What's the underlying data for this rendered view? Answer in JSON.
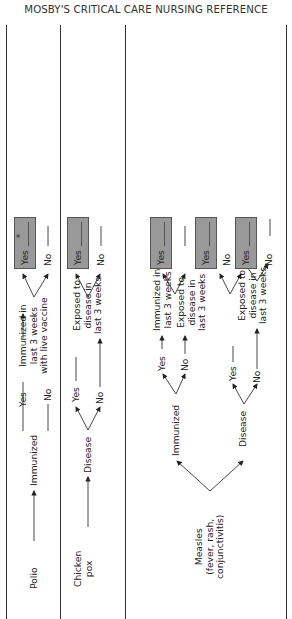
{
  "header": {
    "title": "MOSBY'S CRITICAL CARE NURSING REFERENCE"
  },
  "rows": {
    "polio": {
      "disease": "Polio",
      "branch": "Immunized",
      "yes": "Yes",
      "no": "No",
      "question": [
        "Immunized in",
        "last 3 weeks",
        "with live vaccine"
      ],
      "q_yes": "Yes",
      "q_no": "No",
      "mark": "*"
    },
    "chickenpox": {
      "disease": [
        "Chicken",
        "pox"
      ],
      "branch": "Disease",
      "yes": "Yes",
      "no": "No",
      "question": [
        "Exposed to",
        "disease in",
        "last 3 weeks"
      ],
      "q_yes": "Yes",
      "q_no": "No"
    },
    "measles": {
      "disease": [
        "Measles",
        "(fever, rash,",
        "conjunctivitis)"
      ],
      "branch1": "Immunized",
      "b1_yes": "Yes",
      "b1_no": "No",
      "q1": [
        "Immunized in",
        "last 3 weeks"
      ],
      "q1_yes": "Yes",
      "q1_no": "No",
      "q2": [
        "Exposed to",
        "disease in",
        "last 3 weeks"
      ],
      "q2_yes": "Yes",
      "q2_no": "No",
      "branch2": "Disease",
      "b2_yes": "Yes",
      "b2_no": "No",
      "q3": [
        "Exposed to",
        "disease in",
        "last 3 weeks"
      ],
      "q3_yes": "Yes",
      "q3_no": "No"
    }
  },
  "colors": {
    "box_fill": "#999999",
    "line": "#333333"
  }
}
